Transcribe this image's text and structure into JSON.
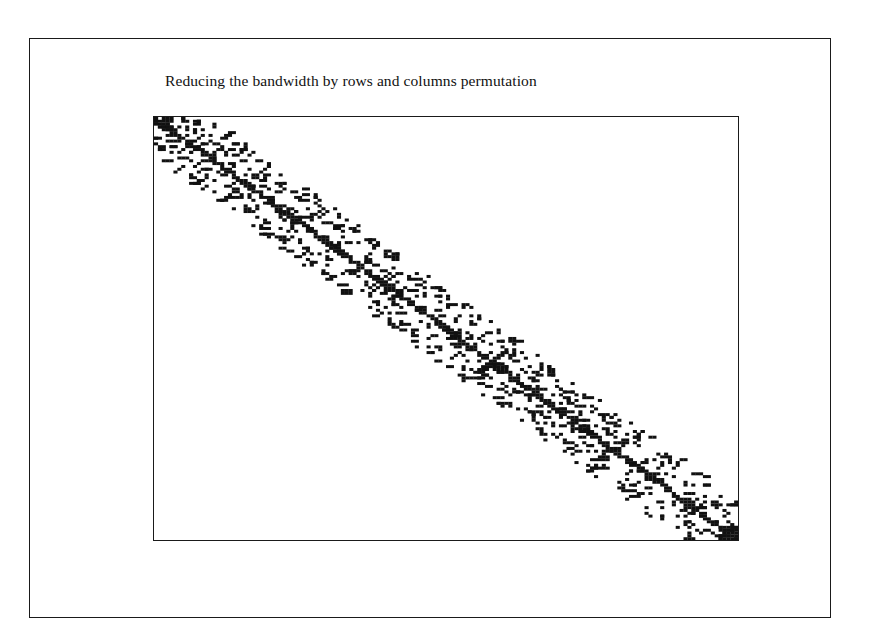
{
  "figure": {
    "title": "Reducing the bandwidth by rows and columns permutation"
  },
  "chart_data": {
    "type": "scatter",
    "subtype": "sparse-matrix-spy-plot",
    "title": "Reducing the bandwidth by rows and columns permutation",
    "xlabel": "",
    "ylabel": "",
    "axes_ticks": "none",
    "grid": false,
    "legend": "none",
    "matrix_extent": {
      "rows": 150,
      "cols": 150
    },
    "band": {
      "main_diagonal": true,
      "approx_half_bandwidth_cols": 14
    },
    "marker_color": "#111111",
    "background_color": "#ffffff"
  }
}
